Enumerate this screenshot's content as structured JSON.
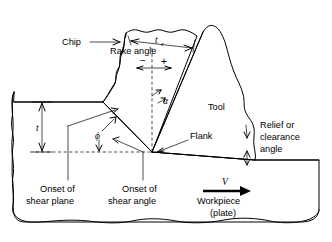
{
  "figure": {
    "background_color": "#ffffff",
    "line_color": "#000000"
  },
  "labels": {
    "chip": "Chip",
    "rake_angle": "Rake angle",
    "tool": "Tool",
    "flank": "Flank",
    "relief_line1": "Relief or",
    "relief_line2": "clearance",
    "relief_line3": "angle",
    "onset_shear_plane_line1": "Onset of",
    "onset_shear_plane_line2": "shear plane",
    "onset_shear_angle_line1": "Onset of",
    "onset_shear_angle_line2": "shear angle",
    "workpiece_line1": "Workpiece",
    "workpiece_line2": "(plate)"
  },
  "symbols": {
    "chip_thickness": "t",
    "chip_thickness_sub": "c",
    "depth_of_cut": "t",
    "rake_angle_symbol": "α",
    "shear_angle_symbol": "ϕ",
    "velocity": "V",
    "negative_sign": "−",
    "positive_sign": "+"
  },
  "icons": {
    "chip_leader": "arrow-right-icon",
    "flank_leader": "arrow-left-down-icon",
    "velocity_arrow": "arrow-right-icon",
    "chip_thickness_dimension": "double-arrow-horizontal-icon",
    "depth_dimension": "double-arrow-vertical-icon",
    "rake_sign_arrows": "double-arrow-horizontal-icon",
    "shear_angle_arc": "double-arrow-arc-icon",
    "relief_leader": "arrow-down-icon"
  }
}
